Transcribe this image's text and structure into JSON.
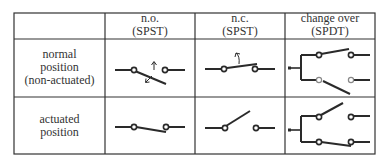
{
  "table": {
    "header": [
      {
        "line1": "",
        "line2": ""
      },
      {
        "line1": "n.o.",
        "line2": "(SPST)"
      },
      {
        "line1": "n.c.",
        "line2": "(SPST)"
      },
      {
        "line1": "change over",
        "line2": "(SPDT)"
      }
    ],
    "rows": [
      {
        "label": [
          "normal",
          "position",
          "(non-actuated)"
        ]
      },
      {
        "label": [
          "actuated",
          "position"
        ]
      }
    ]
  },
  "colors": {
    "line": "#2a2a2a",
    "grid": "#333333"
  }
}
